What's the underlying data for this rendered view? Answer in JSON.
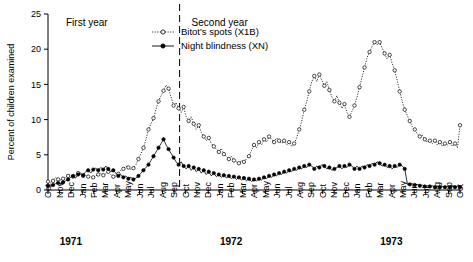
{
  "chart_data": {
    "type": "line",
    "title": "",
    "xlabel": "",
    "ylabel": "Percent of children examined",
    "ylim": [
      0,
      25
    ],
    "yticks": [
      0,
      5,
      10,
      15,
      20,
      25
    ],
    "grid": false,
    "legend_position": "top-center",
    "annotations": [
      {
        "text": "First year",
        "x_month": "Nov 1971"
      },
      {
        "text": "Second year",
        "x_month": "Oct 1972"
      }
    ],
    "divider_note": "dashed vertical line between Sep 1972 and Oct 1972",
    "xtick_labels": [
      "Oct",
      "Nov",
      "Dec",
      "Jan",
      "Feb",
      "Mar",
      "Apr",
      "May",
      "Jun",
      "Jul",
      "Aug",
      "Sep",
      "Oct",
      "Nov",
      "Dec",
      "Jan",
      "Feb",
      "Mar",
      "Apr",
      "May",
      "Jun",
      "Jul",
      "Aug",
      "Sep",
      "Oct",
      "Nov",
      "Dec",
      "Jan",
      "Feb",
      "Mar",
      "Apr",
      "May",
      "Jun",
      "Jul",
      "Aug",
      "Sep",
      "Oct"
    ],
    "year_labels": [
      {
        "label": "1971",
        "tick_index": 2
      },
      {
        "label": "1972",
        "tick_index": 16
      },
      {
        "label": "1973",
        "tick_index": 30
      }
    ],
    "series": [
      {
        "name": "Bitot's spots (X1B)",
        "marker": "open-circle",
        "line": "dotted",
        "color": "#000000",
        "values": [
          1.2,
          1.0,
          1.3,
          1.8,
          1.5,
          1.4,
          1.6,
          1.8,
          2.0,
          2.2,
          1.9,
          2.1,
          2.4,
          2.2,
          2.0,
          2.1,
          1.9,
          1.7,
          1.8,
          2.0,
          2.2,
          2.4,
          2.1,
          2.3,
          2.6,
          2.2,
          1.9,
          2.0,
          2.3,
          2.8,
          3.0,
          3.4,
          3.2,
          2.9,
          3.1,
          3.6,
          4.4,
          5.2,
          6.0,
          7.2,
          8.6,
          9.4,
          10.2,
          11.5,
          12.6,
          13.4,
          14.1,
          14.9,
          14.4,
          13.2,
          12.0,
          12.4,
          11.6,
          11.0,
          11.8,
          10.4,
          9.8,
          10.4,
          9.4,
          8.6,
          9.2,
          8.2,
          7.6,
          7.0,
          7.4,
          6.6,
          6.2,
          5.8,
          5.4,
          5.9,
          5.1,
          4.8,
          4.4,
          4.8,
          4.2,
          4.0,
          3.8,
          4.2,
          4.0,
          4.4,
          4.8,
          5.6,
          6.4,
          6.0,
          6.8,
          6.4,
          7.2,
          6.8,
          7.6,
          7.2,
          6.8,
          7.4,
          7.0,
          6.6,
          7.0,
          6.4,
          6.8,
          6.2,
          6.6,
          7.4,
          8.6,
          9.8,
          11.4,
          12.6,
          14.0,
          15.4,
          16.2,
          15.4,
          16.4,
          15.6,
          14.8,
          15.4,
          14.2,
          13.2,
          12.6,
          13.4,
          12.4,
          11.6,
          12.2,
          11.0,
          10.4,
          11.2,
          12.0,
          13.2,
          14.6,
          16.0,
          17.4,
          18.8,
          19.6,
          20.4,
          21.0,
          20.6,
          21.0,
          20.2,
          19.4,
          18.6,
          19.2,
          18.0,
          17.0,
          15.6,
          14.0,
          12.6,
          11.4,
          10.6,
          9.8,
          9.0,
          8.6,
          8.0,
          7.6,
          7.8,
          7.2,
          6.8,
          7.0,
          6.6,
          7.0,
          6.4,
          6.8,
          6.2,
          6.6,
          6.4,
          6.8,
          6.2,
          6.6,
          6.0,
          9.2
        ]
      },
      {
        "name": "Night blindness (XN)",
        "marker": "filled-circle",
        "line": "solid",
        "color": "#000000",
        "values": [
          0.6,
          0.5,
          0.7,
          0.9,
          1.0,
          0.8,
          1.1,
          1.3,
          1.5,
          1.8,
          2.0,
          1.7,
          2.2,
          2.4,
          2.1,
          2.6,
          2.8,
          2.4,
          2.9,
          3.1,
          2.8,
          3.2,
          2.9,
          3.4,
          3.0,
          2.6,
          2.8,
          2.4,
          2.0,
          2.2,
          1.8,
          2.0,
          1.6,
          1.8,
          1.5,
          1.7,
          2.0,
          2.4,
          2.8,
          3.2,
          3.6,
          4.2,
          4.8,
          5.4,
          6.0,
          6.6,
          7.2,
          6.4,
          5.8,
          5.2,
          4.6,
          4.0,
          3.6,
          4.0,
          3.4,
          3.0,
          3.4,
          2.8,
          3.2,
          2.6,
          3.0,
          2.4,
          2.8,
          2.2,
          2.6,
          2.0,
          2.4,
          1.9,
          2.2,
          1.8,
          2.1,
          1.7,
          2.0,
          1.6,
          1.9,
          1.5,
          1.8,
          1.4,
          1.7,
          1.3,
          1.6,
          1.2,
          1.5,
          1.3,
          1.6,
          1.4,
          1.8,
          1.6,
          2.0,
          1.8,
          2.2,
          2.0,
          2.4,
          2.2,
          2.6,
          2.4,
          2.8,
          2.6,
          3.0,
          2.8,
          3.2,
          3.0,
          3.4,
          3.2,
          3.6,
          3.4,
          3.0,
          3.4,
          3.2,
          3.6,
          3.4,
          3.0,
          3.2,
          2.8,
          3.0,
          3.2,
          3.4,
          3.0,
          3.4,
          3.2,
          3.6,
          3.4,
          3.0,
          3.4,
          3.0,
          3.4,
          3.2,
          3.6,
          3.4,
          3.8,
          3.6,
          4.0,
          3.8,
          3.4,
          3.6,
          3.2,
          3.4,
          3.0,
          3.4,
          3.2,
          3.6,
          3.4,
          3.0,
          1.0,
          0.8,
          0.9,
          0.7,
          0.8,
          0.6,
          0.7,
          0.5,
          0.6,
          0.5,
          0.6,
          0.4,
          0.5,
          0.4,
          0.5,
          0.4,
          0.5,
          0.4,
          0.5,
          0.4,
          0.5,
          0.4
        ]
      }
    ]
  },
  "legend": {
    "items": [
      {
        "label": "Bitot's spots (X1B)",
        "marker": "open-circle"
      },
      {
        "label": "Night blindness (XN)",
        "marker": "filled-circle"
      }
    ]
  },
  "yaxis": {
    "title": "Percent of children examined",
    "ticks": [
      "0",
      "5",
      "10",
      "15",
      "20",
      "25"
    ]
  }
}
